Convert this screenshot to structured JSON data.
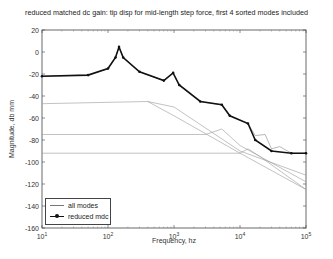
{
  "chart_data": {
    "type": "line",
    "title": "reduced matched dc gain:  tip disp for mid-length step force, first 4 sorted modes included",
    "xlabel": "Frequency, hz",
    "ylabel": "Magnitude, db mm",
    "xscale": "log",
    "xlim": [
      10,
      100000
    ],
    "ylim": [
      -160,
      20
    ],
    "xticks": [
      "10^1",
      "10^2",
      "10^3",
      "10^4",
      "10^5"
    ],
    "yticks": [
      20,
      0,
      -20,
      -40,
      -60,
      -80,
      -100,
      -120,
      -140,
      -160
    ],
    "grid": false,
    "legend_position": "lower left",
    "series": [
      {
        "name": "all modes",
        "style": "thin line",
        "notes": "sum of modal contributions; individual modal curves shown as thin lines",
        "x": [
          10,
          50,
          100,
          130,
          147,
          170,
          300,
          700,
          970,
          1200,
          2500,
          5300,
          7000,
          13200,
          17000,
          24000,
          30000,
          40000,
          60000,
          100000
        ],
        "y": [
          -22,
          -21,
          -15,
          -5,
          4.5,
          -5,
          -18,
          -26,
          -19,
          -30,
          -45,
          -48,
          -58,
          -65,
          -76,
          -75,
          -88,
          -86,
          -92,
          -92
        ]
      },
      {
        "name": "reduced mdc",
        "style": "thick line with dot markers",
        "x": [
          10,
          50,
          100,
          130,
          147,
          170,
          300,
          700,
          970,
          1200,
          2500,
          5300,
          7000,
          13200,
          17000,
          30000,
          60000,
          100000
        ],
        "y": [
          -22,
          -21,
          -15,
          -5,
          4.5,
          -5,
          -18,
          -26,
          -19,
          -30,
          -45,
          -48,
          -58,
          -65,
          -80,
          -90,
          -92,
          -92
        ]
      }
    ],
    "modal_lines": [
      {
        "x": [
          10,
          400,
          1000,
          10000,
          100000
        ],
        "y": [
          -47,
          -45,
          -50,
          -90,
          -112
        ]
      },
      {
        "x": [
          10,
          3000,
          5300,
          10000,
          100000
        ],
        "y": [
          -75,
          -75,
          -70,
          -85,
          -118
        ]
      },
      {
        "x": [
          10,
          10000,
          13200,
          20000,
          100000
        ],
        "y": [
          -92,
          -92,
          -88,
          -95,
          -125
        ]
      },
      {
        "x": [
          400,
          1000,
          10000,
          100000
        ],
        "y": [
          -45,
          -58,
          -92,
          -125
        ]
      }
    ],
    "colors": {
      "all_modes": "#888888",
      "reduced_mdc": "#111111"
    }
  },
  "legend": {
    "items": [
      {
        "label": "all modes"
      },
      {
        "label": "reduced mdc"
      }
    ]
  }
}
